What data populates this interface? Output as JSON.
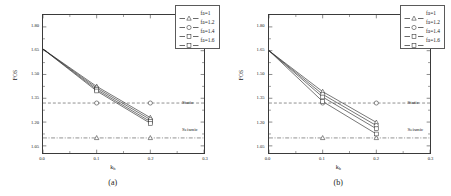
{
  "figure": {
    "panels": [
      {
        "caption": "(a)",
        "legend_title": "",
        "xlabel_main": "k",
        "xlabel_sub": "h",
        "ylabel": "FOS",
        "ref_static_label": "Static",
        "ref_seismic_label": "Seismic"
      },
      {
        "caption": "(b)",
        "legend_title": "",
        "xlabel_main": "k",
        "xlabel_sub": "h",
        "ylabel": "FOS",
        "ref_static_label": "Static",
        "ref_seismic_label": "Seismic"
      }
    ]
  },
  "chart_data": [
    {
      "type": "line",
      "title": "(a)",
      "xlabel": "k_h",
      "ylabel": "FOS",
      "xlim": [
        0.0,
        0.3
      ],
      "ylim": [
        1.005,
        1.875
      ],
      "xticks": [
        0.0,
        0.1,
        0.2,
        0.3
      ],
      "xticklabels": [
        "0.0",
        "0.1",
        "0.2",
        "0.3"
      ],
      "yticks": [
        1.05,
        1.2,
        1.35,
        1.5,
        1.65,
        1.8
      ],
      "yticklabels": [
        "1.05",
        "1.20",
        "1.35",
        "1.50",
        "1.65",
        "1.80"
      ],
      "xminorticks": [
        0.05,
        0.15,
        0.25
      ],
      "yminorticks": [
        1.125,
        1.275,
        1.425,
        1.575,
        1.725
      ],
      "grid": false,
      "legend_position": "upper right",
      "x": [
        0.0,
        0.1,
        0.2
      ],
      "series": [
        {
          "name": "fa=1",
          "marker": "triangle",
          "values": [
            1.66,
            1.425,
            1.228
          ]
        },
        {
          "name": "fa=1.2",
          "marker": "circle",
          "values": [
            1.66,
            1.415,
            1.216
          ]
        },
        {
          "name": "fa=1.4",
          "marker": "square",
          "values": [
            1.66,
            1.405,
            1.203
          ]
        },
        {
          "name": "fa=1.6",
          "marker": "square",
          "values": [
            1.66,
            1.396,
            1.192
          ]
        }
      ],
      "reference_lines": [
        {
          "label": "Static",
          "y": 1.32,
          "style": "dashed"
        },
        {
          "label": "Seismic",
          "y": 1.1,
          "style": "dash-dot"
        }
      ],
      "reference_markers": [
        {
          "line": "Static",
          "x": [
            0.1,
            0.2
          ],
          "marker": "circle"
        },
        {
          "line": "Seismic",
          "x": [
            0.1,
            0.2
          ],
          "marker": "triangle"
        }
      ]
    },
    {
      "type": "line",
      "title": "(b)",
      "xlabel": "k_h",
      "ylabel": "FOS",
      "xlim": [
        0.0,
        0.3
      ],
      "ylim": [
        1.005,
        1.875
      ],
      "xticks": [
        0.0,
        0.1,
        0.2,
        0.3
      ],
      "xticklabels": [
        "0.0",
        "0.1",
        "0.2",
        "0.3"
      ],
      "yticks": [
        1.05,
        1.2,
        1.35,
        1.5,
        1.65,
        1.8
      ],
      "yticklabels": [
        "1.05",
        "1.20",
        "1.35",
        "1.50",
        "1.65",
        "1.80"
      ],
      "xminorticks": [
        0.05,
        0.15,
        0.25
      ],
      "yminorticks": [
        1.125,
        1.275,
        1.425,
        1.575,
        1.725
      ],
      "grid": false,
      "legend_position": "upper right",
      "x": [
        0.0,
        0.1,
        0.2
      ],
      "series": [
        {
          "name": "fa=1",
          "marker": "triangle",
          "values": [
            1.65,
            1.392,
            1.198
          ]
        },
        {
          "name": "fa=1.2",
          "marker": "circle",
          "values": [
            1.65,
            1.375,
            1.178
          ]
        },
        {
          "name": "fa=1.4",
          "marker": "square",
          "values": [
            1.65,
            1.358,
            1.158
          ]
        },
        {
          "name": "fa=1.6",
          "marker": "square",
          "values": [
            1.65,
            1.33,
            1.125
          ]
        }
      ],
      "reference_lines": [
        {
          "label": "Static",
          "y": 1.32,
          "style": "dashed"
        },
        {
          "label": "Seismic",
          "y": 1.1,
          "style": "dash-dot"
        }
      ],
      "reference_markers": [
        {
          "line": "Static",
          "x": [
            0.1,
            0.2
          ],
          "marker": "circle"
        },
        {
          "line": "Seismic",
          "x": [
            0.1,
            0.2
          ],
          "marker": "triangle"
        }
      ]
    }
  ]
}
